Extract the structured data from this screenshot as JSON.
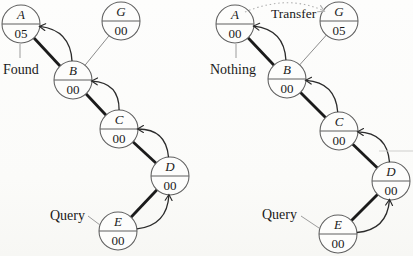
{
  "figure": {
    "background": "#fbfbf9",
    "node_radius": 19,
    "colors": {
      "node_stroke": "#5f5f5f",
      "node_fill": "#fdfdfc",
      "divider": "#5f5f5f",
      "thick_edge": "#1b1b1b",
      "thin_edge": "#8c8c8c",
      "arrow": "#2b2b2b",
      "leader": "#9c9c9c",
      "transfer": "#b0b0b0",
      "text": "#1a1a1a",
      "artifact": "#c9c9c7"
    },
    "diagrams": [
      {
        "id": "left",
        "nodes": [
          {
            "id": "A",
            "label": "A",
            "value": "05",
            "x": 21,
            "y": 24
          },
          {
            "id": "G",
            "label": "G",
            "value": "00",
            "x": 121,
            "y": 21
          },
          {
            "id": "B",
            "label": "B",
            "value": "00",
            "x": 73,
            "y": 80
          },
          {
            "id": "C",
            "label": "C",
            "value": "00",
            "x": 119,
            "y": 129
          },
          {
            "id": "D",
            "label": "D",
            "value": "00",
            "x": 170,
            "y": 176
          },
          {
            "id": "E",
            "label": "E",
            "value": "00",
            "x": 118,
            "y": 231
          }
        ],
        "query_chain": [
          "E",
          "D",
          "C",
          "B",
          "A"
        ],
        "plain_edges": [
          [
            "G",
            "B"
          ]
        ],
        "annotations": [
          {
            "id": "found",
            "text": "Found",
            "x": 3,
            "y": 74,
            "leader": [
              [
                20,
                44
              ],
              [
                20,
                58
              ]
            ]
          },
          {
            "id": "query",
            "text": "Query",
            "x": 50,
            "y": 220,
            "leader": [
              [
                88,
                216
              ],
              [
                100,
                225
              ]
            ]
          }
        ],
        "transfer": null
      },
      {
        "id": "right",
        "nodes": [
          {
            "id": "A",
            "label": "A",
            "value": "00",
            "x": 235,
            "y": 24
          },
          {
            "id": "G",
            "label": "G",
            "value": "05",
            "x": 339,
            "y": 21
          },
          {
            "id": "B",
            "label": "B",
            "value": "00",
            "x": 287,
            "y": 79
          },
          {
            "id": "C",
            "label": "C",
            "value": "00",
            "x": 339,
            "y": 131
          },
          {
            "id": "D",
            "label": "D",
            "value": "00",
            "x": 391,
            "y": 181
          },
          {
            "id": "E",
            "label": "E",
            "value": "00",
            "x": 338,
            "y": 234
          }
        ],
        "query_chain": [
          "E",
          "D",
          "C",
          "B",
          "A"
        ],
        "plain_edges": [
          [
            "G",
            "B"
          ]
        ],
        "annotations": [
          {
            "id": "nothing",
            "text": "Nothing",
            "x": 210,
            "y": 74,
            "leader": [
              [
                236,
                44
              ],
              [
                236,
                58
              ]
            ]
          },
          {
            "id": "query",
            "text": "Query",
            "x": 262,
            "y": 219,
            "leader": [
              [
                301,
                216
              ],
              [
                319,
                228
              ]
            ]
          }
        ],
        "transfer": {
          "text": "Transfer",
          "label_x": 271,
          "label_y": 18,
          "from": [
            245,
            12
          ],
          "ctrl": [
            288,
            -6
          ],
          "to": [
            324,
            11
          ]
        }
      }
    ],
    "artifact_line": {
      "x1": 379,
      "y1": 151,
      "x2": 413,
      "y2": 151
    }
  }
}
